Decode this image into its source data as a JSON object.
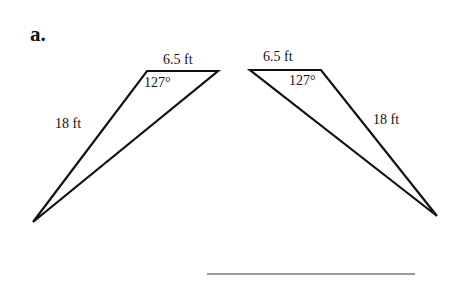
{
  "part_label": "a.",
  "triangles": [
    {
      "name": "left",
      "top_side": "6.5 ft",
      "angle": "127°",
      "long_side": "18 ft",
      "vertices": {
        "top_left": [
          147,
          71
        ],
        "top_right": [
          218,
          71
        ],
        "bottom": [
          33,
          222
        ]
      }
    },
    {
      "name": "right",
      "top_side": "6.5 ft",
      "angle": "127°",
      "long_side": "18 ft",
      "vertices": {
        "top_left": [
          250,
          70
        ],
        "top_right": [
          321,
          70
        ],
        "bottom": [
          437,
          216
        ]
      }
    }
  ],
  "answer_line": {
    "x1": 207,
    "x2": 415,
    "y": 274
  },
  "colors": {
    "stroke": "#111111",
    "background": "#ffffff"
  }
}
